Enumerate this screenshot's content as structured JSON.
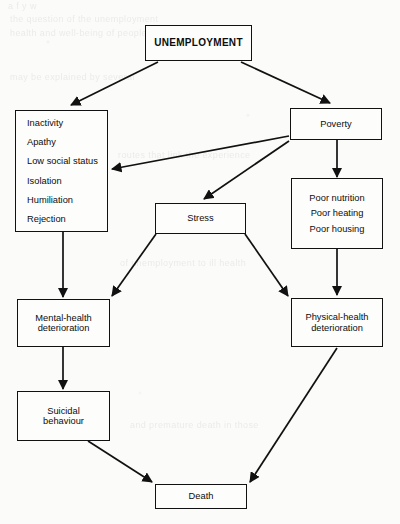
{
  "diagram": {
    "type": "flowchart",
    "stroke_color": "#111111",
    "background_color": "#fbfbfa",
    "nodes": [
      {
        "id": "unemployment",
        "label": "UNEMPLOYMENT"
      },
      {
        "id": "psychosocial",
        "items": [
          "Inactivity",
          "Apathy",
          "Low social status",
          "Isolation",
          "Humiliation",
          "Rejection"
        ]
      },
      {
        "id": "poverty",
        "label": "Poverty"
      },
      {
        "id": "stress",
        "label": "Stress"
      },
      {
        "id": "material",
        "items": [
          "Poor nutrition",
          "Poor heating",
          "Poor housing"
        ]
      },
      {
        "id": "mental",
        "line1": "Mental-health",
        "line2": "deterioration"
      },
      {
        "id": "physical",
        "line1": "Physical-health",
        "line2": "deterioration"
      },
      {
        "id": "suicide",
        "line1": "Suicidal",
        "line2": "behaviour"
      },
      {
        "id": "death",
        "label": "Death"
      }
    ],
    "edges": [
      {
        "from": "unemployment",
        "to": "psychosocial"
      },
      {
        "from": "unemployment",
        "to": "poverty"
      },
      {
        "from": "poverty",
        "to": "psychosocial"
      },
      {
        "from": "poverty",
        "to": "stress"
      },
      {
        "from": "poverty",
        "to": "material"
      },
      {
        "from": "psychosocial",
        "to": "mental"
      },
      {
        "from": "stress",
        "to": "mental"
      },
      {
        "from": "stress",
        "to": "physical"
      },
      {
        "from": "material",
        "to": "physical"
      },
      {
        "from": "mental",
        "to": "suicide"
      },
      {
        "from": "suicide",
        "to": "death"
      },
      {
        "from": "physical",
        "to": "death"
      }
    ]
  },
  "page_artifacts": {
    "ghost_lines": [
      "a          f       y              w",
      "the         question of          the        unemployment",
      "health    and   well-being     of    people      who",
      "may         be        explained        by        several",
      "routes      that       link      the       experience",
      "of      unemployment        to       ill      health",
      "and       premature        death       in       those"
    ]
  }
}
